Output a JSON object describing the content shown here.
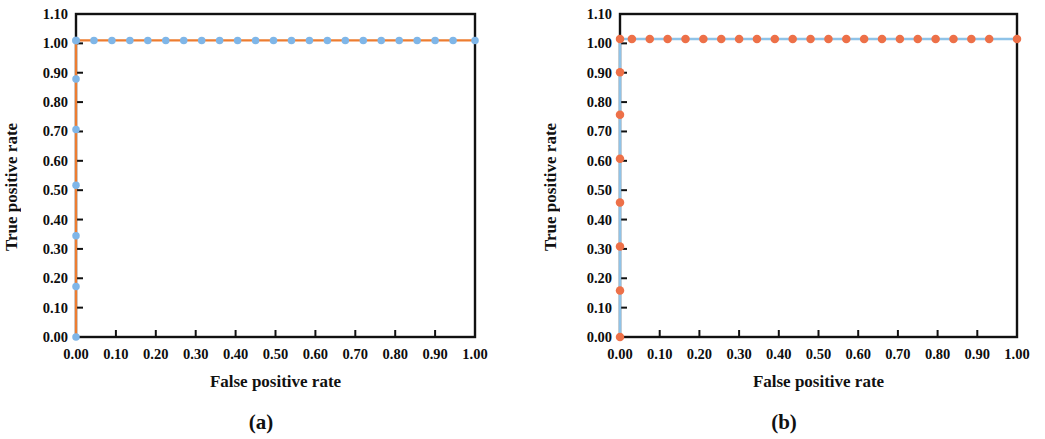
{
  "figure": {
    "background": "#ffffff",
    "panels": [
      {
        "key": "a",
        "caption": "(a)"
      },
      {
        "key": "b",
        "caption": "(b)"
      }
    ]
  },
  "chart_data": [
    {
      "panel": "a",
      "caption": "(a)",
      "type": "line",
      "title": "",
      "xlabel": "False positive rate",
      "ylabel": "True positive rate",
      "xlim": [
        0.0,
        1.0
      ],
      "ylim": [
        0.0,
        1.1
      ],
      "grid": false,
      "legend": "none",
      "xticks": [
        "0.00",
        "0.10",
        "0.20",
        "0.30",
        "0.40",
        "0.50",
        "0.60",
        "0.70",
        "0.80",
        "0.90",
        "1.00"
      ],
      "xtick_values": [
        0.0,
        0.1,
        0.2,
        0.3,
        0.4,
        0.5,
        0.6,
        0.7,
        0.8,
        0.9,
        1.0
      ],
      "yticks": [
        "0.00",
        "0.10",
        "0.20",
        "0.30",
        "0.40",
        "0.50",
        "0.60",
        "0.70",
        "0.80",
        "0.90",
        "1.00",
        "1.10"
      ],
      "ytick_values": [
        0.0,
        0.1,
        0.2,
        0.3,
        0.4,
        0.5,
        0.6,
        0.7,
        0.8,
        0.9,
        1.0,
        1.1
      ],
      "line_color": "#ED7D31",
      "marker_color": "#7FB6E8",
      "marker_size": 7.5,
      "line_width": 2.2,
      "series": [
        {
          "name": "ROC curve",
          "x": [
            0.0,
            0.0,
            0.0,
            0.0,
            0.0,
            0.0,
            0.0,
            0.0,
            0.045,
            0.09,
            0.135,
            0.18,
            0.225,
            0.27,
            0.315,
            0.36,
            0.405,
            0.45,
            0.495,
            0.54,
            0.585,
            0.63,
            0.675,
            0.72,
            0.765,
            0.81,
            0.855,
            0.9,
            0.945,
            1.0
          ],
          "y": [
            0.0,
            0.172,
            0.345,
            0.517,
            0.707,
            0.879,
            1.01,
            1.01,
            1.01,
            1.01,
            1.01,
            1.01,
            1.01,
            1.01,
            1.01,
            1.01,
            1.01,
            1.01,
            1.01,
            1.01,
            1.01,
            1.01,
            1.01,
            1.01,
            1.01,
            1.01,
            1.01,
            1.01,
            1.01,
            1.01
          ]
        }
      ]
    },
    {
      "panel": "b",
      "caption": "(b)",
      "type": "line",
      "title": "",
      "xlabel": "False positive rate",
      "ylabel": "True positive rate",
      "xlim": [
        0.0,
        1.0
      ],
      "ylim": [
        0.0,
        1.1
      ],
      "grid": false,
      "legend": "none",
      "xticks": [
        "0.00",
        "0.10",
        "0.20",
        "0.30",
        "0.40",
        "0.50",
        "0.60",
        "0.70",
        "0.80",
        "0.90",
        "1.00"
      ],
      "xtick_values": [
        0.0,
        0.1,
        0.2,
        0.3,
        0.4,
        0.5,
        0.6,
        0.7,
        0.8,
        0.9,
        1.0
      ],
      "yticks": [
        "0.00",
        "0.10",
        "0.20",
        "0.30",
        "0.40",
        "0.50",
        "0.60",
        "0.70",
        "0.80",
        "0.90",
        "1.00",
        "1.10"
      ],
      "ytick_values": [
        0.0,
        0.1,
        0.2,
        0.3,
        0.4,
        0.5,
        0.6,
        0.7,
        0.8,
        0.9,
        1.0,
        1.1
      ],
      "line_color": "#8FC3E8",
      "marker_color": "#ED7048",
      "marker_size": 8.5,
      "line_width": 2.4,
      "series": [
        {
          "name": "ROC curve",
          "x": [
            0.0,
            0.0,
            0.0,
            0.0,
            0.0,
            0.0,
            0.0,
            0.0,
            0.03,
            0.075,
            0.12,
            0.165,
            0.21,
            0.255,
            0.3,
            0.345,
            0.39,
            0.435,
            0.48,
            0.525,
            0.57,
            0.615,
            0.66,
            0.705,
            0.75,
            0.795,
            0.84,
            0.885,
            0.93,
            1.0
          ],
          "y": [
            0.0,
            0.158,
            0.308,
            0.458,
            0.607,
            0.757,
            0.902,
            1.015,
            1.015,
            1.015,
            1.015,
            1.015,
            1.015,
            1.015,
            1.015,
            1.015,
            1.015,
            1.015,
            1.015,
            1.015,
            1.015,
            1.015,
            1.015,
            1.015,
            1.015,
            1.015,
            1.015,
            1.015,
            1.015,
            1.015
          ]
        }
      ]
    }
  ]
}
